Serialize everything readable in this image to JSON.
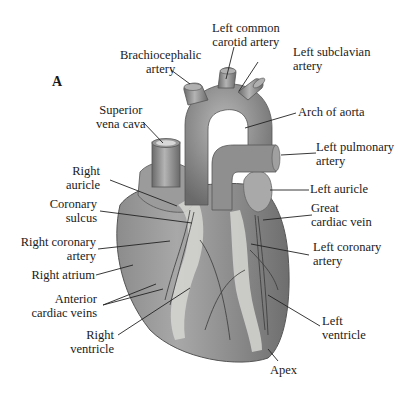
{
  "figure": {
    "panel_letter": "A",
    "colors": {
      "tissue_dark": "#6f6f6f",
      "tissue_mid": "#9a9a9a",
      "tissue_light": "#c8c8c8",
      "fat": "#d9d9d6",
      "leader": "#222222"
    },
    "labels": {
      "brachiocephalic": [
        "Brachiocephalic",
        "artery"
      ],
      "left_common_carotid": [
        "Left common",
        "carotid artery"
      ],
      "left_subclavian": [
        "Left subclavian",
        "artery"
      ],
      "superior_vena_cava": [
        "Superior",
        "vena cava"
      ],
      "arch_of_aorta": [
        "Arch of aorta"
      ],
      "left_pulmonary": [
        "Left pulmonary",
        "artery"
      ],
      "right_auricle": [
        "Right",
        "auricle"
      ],
      "left_auricle": [
        "Left auricle"
      ],
      "coronary_sulcus": [
        "Coronary",
        "sulcus"
      ],
      "great_cardiac_vein": [
        "Great",
        "cardiac vein"
      ],
      "right_coronary": [
        "Right coronary",
        "artery"
      ],
      "left_coronary": [
        "Left coronary",
        "artery"
      ],
      "right_atrium": [
        "Right atrium"
      ],
      "anterior_cardiac_veins": [
        "Anterior",
        "cardiac veins"
      ],
      "right_ventricle": [
        "Right",
        "ventricle"
      ],
      "left_ventricle": [
        "Left",
        "ventricle"
      ],
      "apex": [
        "Apex"
      ]
    }
  }
}
